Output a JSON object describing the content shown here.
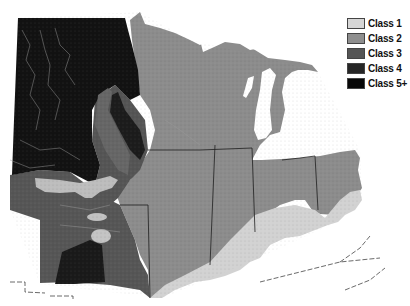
{
  "map": {
    "description": "Grayscale classification map of the upper Midwest / Great Lakes region",
    "colors": {
      "background": "#ffffff",
      "class1": "#cfcfcf",
      "class2": "#8f8f8f",
      "class3": "#5a5a5a",
      "class4": "#2e2e2e",
      "class5": "#0e0e0e",
      "water": "#ffffff",
      "border": "#222222"
    }
  },
  "legend": {
    "items": [
      {
        "label": "Class 1",
        "color": "#d6d6d6"
      },
      {
        "label": "Class 2",
        "color": "#8e8e8e"
      },
      {
        "label": "Class 3",
        "color": "#555555"
      },
      {
        "label": "Class 4",
        "color": "#262626"
      },
      {
        "label": "Class 5+",
        "color": "#080808"
      }
    ]
  }
}
